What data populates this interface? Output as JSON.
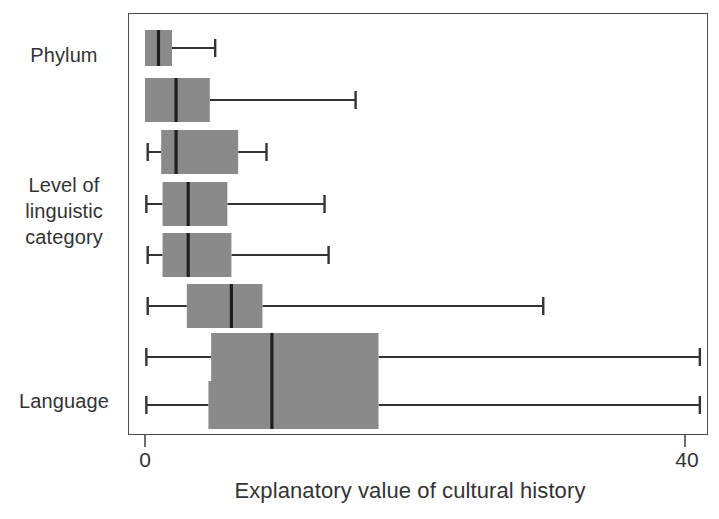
{
  "chart_data": {
    "type": "box",
    "title": "",
    "xlabel": "Explanatory value of cultural history",
    "ylabel": "Level of linguistic category",
    "xlim": [
      0,
      41.5
    ],
    "xticks": [
      0,
      40
    ],
    "xtick_labels": [
      "0",
      "40"
    ],
    "grid": false,
    "legend": null,
    "orientation": "horizontal",
    "y_group_labels": [
      {
        "text": "Phylum",
        "lines": [
          "Phylum"
        ]
      },
      {
        "text": "Level of linguistic category",
        "lines": [
          "Level of",
          "linguistic",
          "category"
        ]
      },
      {
        "text": "Language",
        "lines": [
          "Language"
        ]
      }
    ],
    "box_fill_color": "#8a8a8a",
    "box_line_color": "#333333",
    "boxes": [
      {
        "name": "Phylum",
        "min": 0.0,
        "q1": 0.0,
        "median": 1.0,
        "q3": 2.0,
        "max": 5.2,
        "left_whisker_visible": false
      },
      {
        "name": "row-2",
        "min": 0.0,
        "q1": 0.0,
        "median": 2.3,
        "q3": 4.8,
        "max": 15.6,
        "left_whisker_visible": false
      },
      {
        "name": "row-3",
        "min": 0.2,
        "q1": 1.2,
        "median": 2.3,
        "q3": 6.9,
        "max": 9.0,
        "left_whisker_visible": true
      },
      {
        "name": "row-4",
        "min": 0.1,
        "q1": 1.3,
        "median": 3.2,
        "q3": 6.1,
        "max": 13.3,
        "left_whisker_visible": true
      },
      {
        "name": "row-5",
        "min": 0.2,
        "q1": 1.3,
        "median": 3.2,
        "q3": 6.4,
        "max": 13.6,
        "left_whisker_visible": true
      },
      {
        "name": "row-6",
        "min": 0.2,
        "q1": 3.1,
        "median": 6.4,
        "q3": 8.7,
        "max": 29.5,
        "left_whisker_visible": true
      },
      {
        "name": "row-7",
        "min": 0.1,
        "q1": 4.9,
        "median": 9.4,
        "q3": 17.3,
        "max": 41.1,
        "left_whisker_visible": true
      },
      {
        "name": "Language",
        "min": 0.1,
        "q1": 4.7,
        "median": 9.4,
        "q3": 17.3,
        "max": 41.1,
        "left_whisker_visible": true
      }
    ]
  },
  "axis": {
    "tick_0": "0",
    "tick_40": "40",
    "x_title": "Explanatory value of cultural history"
  },
  "labels": {
    "phylum": "Phylum",
    "level_line1": "Level of",
    "level_line2": "linguistic",
    "level_line3": "category",
    "language": "Language"
  },
  "colors": {
    "box_fill": "#8a8a8a",
    "line": "#333333",
    "frame": "#4a4a4a",
    "background": "#ffffff"
  }
}
